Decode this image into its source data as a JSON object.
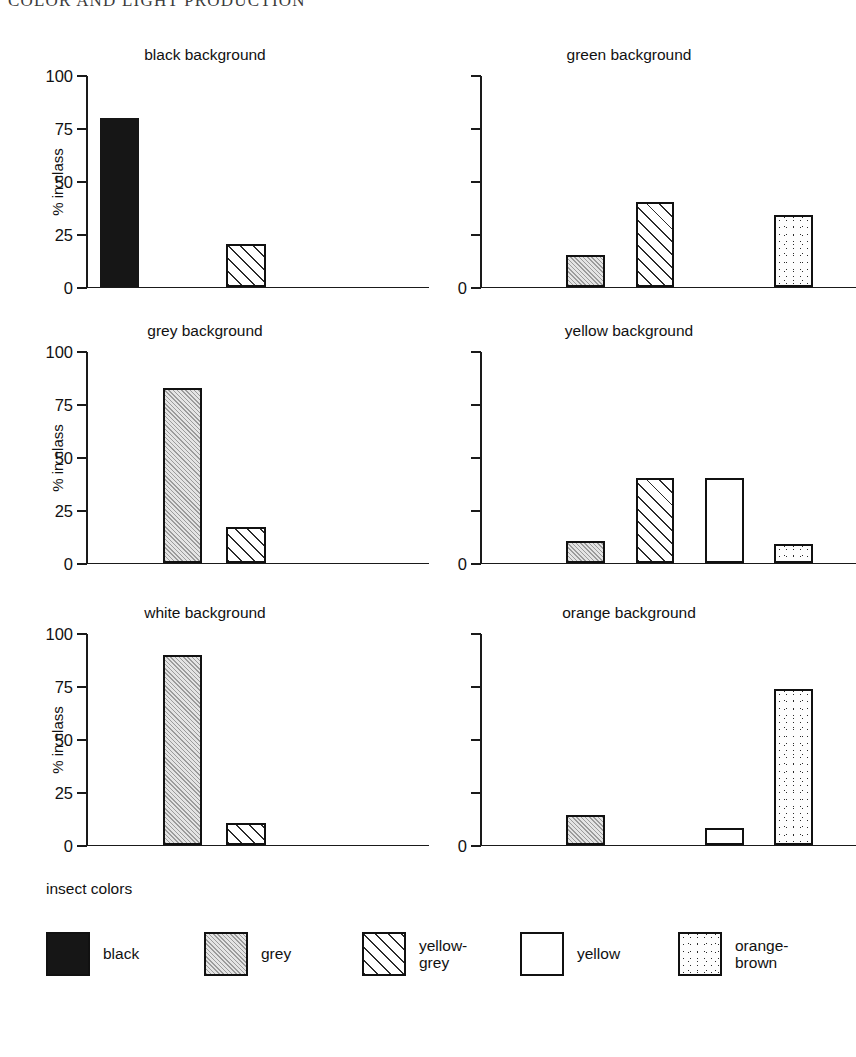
{
  "running_head": "COLOR AND LIGHT PRODUCTION",
  "legend": {
    "title": "insect colors",
    "items": [
      {
        "key": "black",
        "label": "black"
      },
      {
        "key": "grey",
        "label": "grey"
      },
      {
        "key": "yellow-grey",
        "label": "yellow-\ngrey"
      },
      {
        "key": "yellow",
        "label": "yellow"
      },
      {
        "key": "orange-brown",
        "label": "orange-\nbrown"
      }
    ]
  },
  "axis": {
    "ylabel": "% in class",
    "ticks_labeled": [
      "100",
      "75",
      "50",
      "25",
      "0"
    ],
    "tick_zero_only": "0"
  },
  "chart_data": {
    "type": "bar",
    "xlabel": "",
    "ylabel": "% in class",
    "ylim": [
      0,
      100
    ],
    "yticks": [
      0,
      25,
      50,
      75,
      100
    ],
    "grid": false,
    "legend_position": "bottom",
    "categories": [
      "black",
      "grey",
      "yellow-grey",
      "yellow",
      "orange-brown"
    ],
    "panels": [
      {
        "title": "black background",
        "y_axis_labeled": true,
        "values": [
          80,
          0,
          20,
          0,
          0
        ]
      },
      {
        "title": "green background",
        "y_axis_labeled": false,
        "values": [
          0,
          15,
          40,
          0,
          34
        ]
      },
      {
        "title": "grey background",
        "y_axis_labeled": true,
        "values": [
          0,
          83,
          17,
          0,
          0
        ]
      },
      {
        "title": "yellow background",
        "y_axis_labeled": false,
        "values": [
          0,
          10,
          40,
          40,
          9
        ]
      },
      {
        "title": "white background",
        "y_axis_labeled": true,
        "values": [
          0,
          90,
          10,
          0,
          0
        ]
      },
      {
        "title": "orange background",
        "y_axis_labeled": false,
        "values": [
          0,
          14,
          0,
          8,
          74
        ]
      }
    ]
  }
}
